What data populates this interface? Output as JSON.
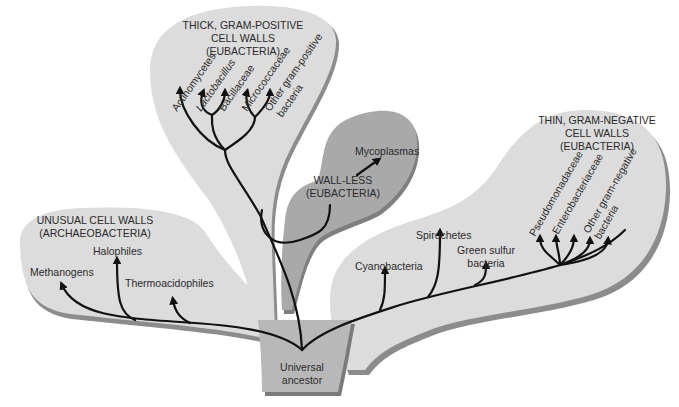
{
  "colors": {
    "background": "#ffffff",
    "light_region": "#d9d9d9",
    "region_shadow": "#8c8c8c",
    "wall_less_region": "#a9a9a9",
    "ancestor_region": "#b8b8b8",
    "branch": "#111111",
    "text": "#2a2a2a"
  },
  "groups": {
    "archaeobacteria": {
      "header": [
        "UNUSUAL CELL WALLS",
        "(ARCHAEOBACTERIA)"
      ],
      "taxa": [
        "Methanogens",
        "Halophiles",
        "Thermoacidophiles"
      ]
    },
    "gram_positive": {
      "header": [
        "THICK, GRAM-POSITIVE",
        "CELL WALLS",
        "(EUBACTERIA)"
      ],
      "taxa": [
        "Actinomycetes",
        "Lactobacillus",
        "Bacillaceae",
        "Micrococcaceae",
        "Other gram-positive",
        "bacteria"
      ]
    },
    "wall_less": {
      "header": [
        "WALL-LESS",
        "(EUBACTERIA)"
      ],
      "taxa": [
        "Mycoplasmas"
      ]
    },
    "gram_negative": {
      "header": [
        "THIN, GRAM-NEGATIVE",
        "CELL WALLS",
        "(EUBACTERIA)"
      ],
      "taxa": [
        "Cyanobacteria",
        "Spirochetes",
        "Green sulfur",
        "bacteria",
        "Pseudomonadaceae",
        "Enterobacteriaceae",
        "Other gram-negative",
        "bacteria"
      ]
    }
  },
  "root": {
    "label": [
      "Universal",
      "ancestor"
    ]
  }
}
